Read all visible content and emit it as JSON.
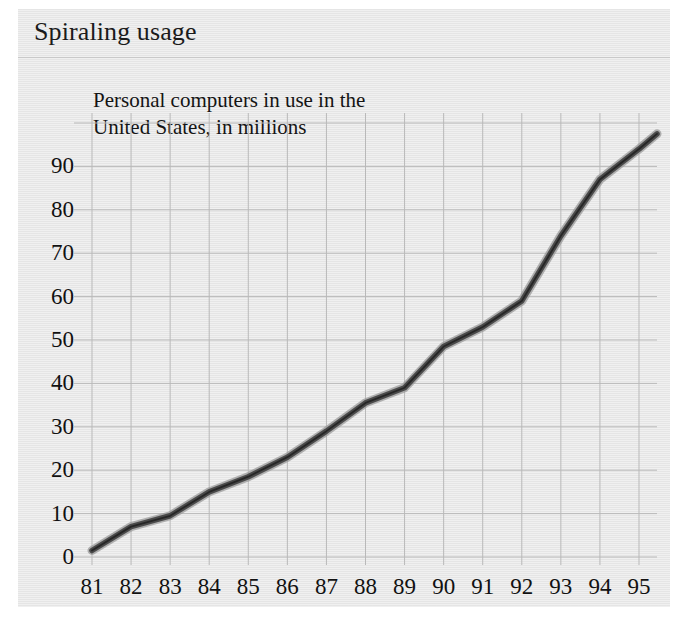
{
  "panel": {
    "title": "Spiraling usage",
    "background_color": "#e8e8e8",
    "divider_color": "#c9c9c9"
  },
  "chart_data": {
    "type": "line",
    "title": "Spiraling usage",
    "subtitle_lines": [
      "Personal computers in use in the",
      "United States, in millions"
    ],
    "subtitle": "Personal computers in use in the United States, in millions",
    "xlabel": "",
    "ylabel": "",
    "categories": [
      "81",
      "82",
      "83",
      "84",
      "85",
      "86",
      "87",
      "88",
      "89",
      "90",
      "91",
      "92",
      "93",
      "94",
      "95"
    ],
    "x": [
      81,
      82,
      83,
      84,
      85,
      86,
      87,
      88,
      89,
      90,
      91,
      92,
      93,
      94,
      95
    ],
    "values": [
      1.5,
      7,
      9.5,
      15,
      18.5,
      23,
      29,
      35.5,
      39,
      48.5,
      53,
      59,
      74,
      87,
      94
    ],
    "series": [
      {
        "name": "Personal computers in use in the United States, in millions",
        "values": [
          1.5,
          7,
          9.5,
          15,
          18.5,
          23,
          29,
          35.5,
          39,
          48.5,
          53,
          59,
          74,
          87,
          94
        ],
        "color": "#4d4d4d"
      }
    ],
    "yticks": [
      0,
      10,
      20,
      30,
      40,
      50,
      60,
      70,
      80,
      90
    ],
    "ytick_labels": [
      "0",
      "10",
      "20",
      "30",
      "40",
      "50",
      "60",
      "70",
      "80",
      "90"
    ],
    "xtick_labels": [
      "81",
      "82",
      "83",
      "84",
      "85",
      "86",
      "87",
      "88",
      "89",
      "90",
      "91",
      "92",
      "93",
      "94",
      "95"
    ],
    "ylim": [
      0,
      100
    ],
    "xlim": [
      81,
      95
    ],
    "grid": true,
    "grid_color": "#b9b9b9",
    "legend": "none",
    "line_color": "#4a4a4a",
    "line_width": 6
  }
}
